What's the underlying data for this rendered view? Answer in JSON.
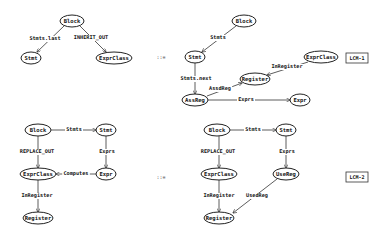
{
  "rules": [
    {
      "name": "LCM-1",
      "rewrite_symbol": "::=",
      "lhs": {
        "nodes": [
          {
            "id": "block",
            "label": "Block",
            "x": 72,
            "y": 21,
            "rx": 12,
            "ry": 6
          },
          {
            "id": "stmt",
            "label": "Stmt",
            "x": 31,
            "y": 58,
            "rx": 10,
            "ry": 6
          },
          {
            "id": "exprclass",
            "label": "ExprClass",
            "x": 114,
            "y": 58,
            "rx": 18,
            "ry": 6
          }
        ],
        "edges": [
          {
            "from": "block",
            "to": "stmt",
            "label": "Stmts.last",
            "x1": 64,
            "y1": 26,
            "x2": 37,
            "y2": 52,
            "lx": 45,
            "ly": 39
          },
          {
            "from": "block",
            "to": "exprclass",
            "label": "INHERIT_OUT",
            "x1": 80,
            "y1": 26,
            "x2": 106,
            "y2": 52,
            "lx": 91,
            "ly": 38
          }
        ]
      },
      "rhs": {
        "nodes": [
          {
            "id": "block",
            "label": "Block",
            "x": 244,
            "y": 21,
            "rx": 12,
            "ry": 6
          },
          {
            "id": "stmt",
            "label": "Stmt",
            "x": 195,
            "y": 57,
            "rx": 10,
            "ry": 6
          },
          {
            "id": "exprclass",
            "label": "ExprClass",
            "x": 321,
            "y": 57,
            "rx": 17,
            "ry": 6
          },
          {
            "id": "register",
            "label": "Register",
            "x": 255,
            "y": 79,
            "rx": 15,
            "ry": 6
          },
          {
            "id": "assreg",
            "label": "AssReg",
            "x": 195,
            "y": 100,
            "rx": 13,
            "ry": 6
          },
          {
            "id": "expr",
            "label": "Expr",
            "x": 300,
            "y": 100,
            "rx": 10,
            "ry": 6
          }
        ],
        "edges": [
          {
            "from": "block",
            "to": "stmt",
            "label": "Stmts",
            "x1": 236,
            "y1": 26,
            "x2": 202,
            "y2": 52,
            "lx": 218,
            "ly": 38
          },
          {
            "from": "stmt",
            "to": "assreg",
            "label": "Stmts.next",
            "x1": 195,
            "y1": 63,
            "x2": 195,
            "y2": 94,
            "lx": 196,
            "ly": 79
          },
          {
            "from": "exprclass",
            "to": "register",
            "label": "InRegister",
            "x1": 308,
            "y1": 62,
            "x2": 267,
            "y2": 75,
            "lx": 287,
            "ly": 67
          },
          {
            "from": "assreg",
            "to": "register",
            "label": "AssdReg",
            "x1": 207,
            "y1": 96,
            "x2": 242,
            "y2": 83,
            "lx": 220,
            "ly": 89
          },
          {
            "from": "assreg",
            "to": "expr",
            "label": "Exprs",
            "x1": 208,
            "y1": 100,
            "x2": 290,
            "y2": 100,
            "lx": 246,
            "ly": 100
          }
        ]
      }
    },
    {
      "name": "LCM-2",
      "rewrite_symbol": "::=",
      "lhs": {
        "nodes": [
          {
            "id": "block",
            "label": "Block",
            "x": 38,
            "y": 130,
            "rx": 13,
            "ry": 6
          },
          {
            "id": "stmt",
            "label": "Stmt",
            "x": 106,
            "y": 130,
            "rx": 10,
            "ry": 6
          },
          {
            "id": "exprclass",
            "label": "ExprClass",
            "x": 38,
            "y": 174,
            "rx": 18,
            "ry": 6
          },
          {
            "id": "expr",
            "label": "Expr",
            "x": 106,
            "y": 174,
            "rx": 10,
            "ry": 6
          },
          {
            "id": "register",
            "label": "Register",
            "x": 38,
            "y": 218,
            "rx": 15,
            "ry": 6
          }
        ],
        "edges": [
          {
            "from": "block",
            "to": "stmt",
            "label": "Stmts",
            "x1": 51,
            "y1": 130,
            "x2": 96,
            "y2": 130,
            "lx": 74,
            "ly": 130
          },
          {
            "from": "block",
            "to": "exprclass",
            "label": "REPLACE_OUT",
            "x1": 38,
            "y1": 136,
            "x2": 38,
            "y2": 168,
            "lx": 37,
            "ly": 152
          },
          {
            "from": "stmt",
            "to": "expr",
            "label": "Exprs",
            "x1": 106,
            "y1": 136,
            "x2": 106,
            "y2": 168,
            "lx": 107,
            "ly": 152
          },
          {
            "from": "expr",
            "to": "exprclass",
            "label": "Computes",
            "x1": 96,
            "y1": 174,
            "x2": 56,
            "y2": 174,
            "lx": 76,
            "ly": 174
          },
          {
            "from": "exprclass",
            "to": "register",
            "label": "InRegister",
            "x1": 38,
            "y1": 180,
            "x2": 38,
            "y2": 212,
            "lx": 37,
            "ly": 196
          }
        ]
      },
      "rhs": {
        "nodes": [
          {
            "id": "block",
            "label": "Block",
            "x": 217,
            "y": 130,
            "rx": 13,
            "ry": 6
          },
          {
            "id": "stmt",
            "label": "Stmt",
            "x": 286,
            "y": 130,
            "rx": 10,
            "ry": 6
          },
          {
            "id": "exprclass",
            "label": "ExprClass",
            "x": 219,
            "y": 174,
            "rx": 18,
            "ry": 6
          },
          {
            "id": "usereg",
            "label": "UseReg",
            "x": 286,
            "y": 174,
            "rx": 13,
            "ry": 6
          },
          {
            "id": "register",
            "label": "Register",
            "x": 219,
            "y": 218,
            "rx": 15,
            "ry": 6
          }
        ],
        "edges": [
          {
            "from": "block",
            "to": "stmt",
            "label": "Stmts",
            "x1": 230,
            "y1": 130,
            "x2": 276,
            "y2": 130,
            "lx": 253,
            "ly": 130
          },
          {
            "from": "block",
            "to": "exprclass",
            "label": "REPLACE_OUT",
            "x1": 219,
            "y1": 136,
            "x2": 219,
            "y2": 168,
            "lx": 218,
            "ly": 152
          },
          {
            "from": "stmt",
            "to": "usereg",
            "label": "Exprs",
            "x1": 286,
            "y1": 136,
            "x2": 286,
            "y2": 168,
            "lx": 287,
            "ly": 152
          },
          {
            "from": "exprclass",
            "to": "register",
            "label": "InRegister",
            "x1": 219,
            "y1": 180,
            "x2": 219,
            "y2": 212,
            "lx": 219,
            "ly": 196
          },
          {
            "from": "usereg",
            "to": "register",
            "label": "UsedReg",
            "x1": 277,
            "y1": 179,
            "x2": 233,
            "y2": 213,
            "lx": 257,
            "ly": 196
          }
        ]
      }
    }
  ],
  "rule_labels": [
    {
      "text": "LCM-1",
      "x": 357,
      "y": 58,
      "w": 22,
      "h": 10
    },
    {
      "text": "LCM-2",
      "x": 357,
      "y": 177,
      "w": 22,
      "h": 10
    }
  ],
  "rewrite_symbols": [
    {
      "text": "::=",
      "x": 161,
      "y": 58
    },
    {
      "text": "::=",
      "x": 161,
      "y": 178
    }
  ]
}
